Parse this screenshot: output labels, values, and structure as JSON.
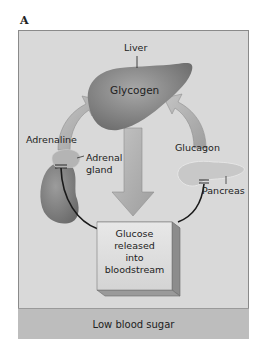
{
  "panel_label": "A",
  "diagram": {
    "organs": {
      "liver": {
        "label": "Liver",
        "content": "Glycogen"
      },
      "adrenal": {
        "label_line1": "Adrenal",
        "label_line2": "gland"
      },
      "pancreas": {
        "label": "Pancreas"
      }
    },
    "hormones": {
      "adrenaline": "Adrenaline",
      "glucagon": "Glucagon"
    },
    "process_box": {
      "line1": "Glucose",
      "line2": "released",
      "line3": "into",
      "line4": "bloodstream"
    },
    "condition": "Low blood sugar"
  },
  "colors": {
    "frame_bg": "#d9d9d9",
    "footer_bg": "#bdbdbd",
    "organ": "#8c8c8c",
    "arrow": "#b0b0b0",
    "line": "#1a1a1a"
  }
}
